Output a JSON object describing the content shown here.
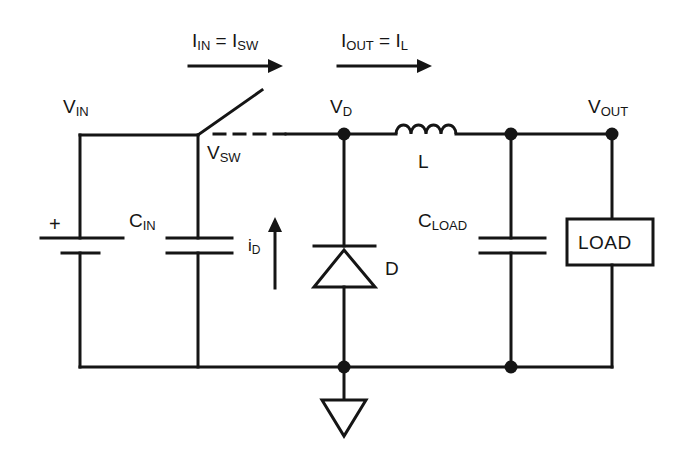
{
  "diagram": {
    "type": "circuit-schematic",
    "stroke_color": "#151515",
    "background_color": "#ffffff",
    "line_width": 3
  },
  "labels": {
    "i_in": {
      "main1": "I",
      "sub1": "IN",
      "eq": " = ",
      "main2": "I",
      "sub2": "SW"
    },
    "i_out": {
      "main1": "I",
      "sub1": "OUT",
      "eq": " = ",
      "main2": "I",
      "sub2": "L"
    },
    "v_in": {
      "main": "V",
      "sub": "IN"
    },
    "v_sw": {
      "main": "V",
      "sub": "SW"
    },
    "v_d": {
      "main": "V",
      "sub": "D"
    },
    "v_out": {
      "main": "V",
      "sub": "OUT"
    },
    "c_in": {
      "main": "C",
      "sub": "IN"
    },
    "c_load": {
      "main": "C",
      "sub": "LOAD"
    },
    "i_d": {
      "main": "i",
      "sub": "D"
    },
    "inductor": {
      "main": "L",
      "sub": ""
    },
    "diode": {
      "main": "D",
      "sub": ""
    },
    "load_box": "LOAD",
    "battery_plus": "+"
  },
  "components": [
    {
      "name": "voltage-source-battery",
      "label": "+",
      "terminal_top": "VIN",
      "terminal_bottom": "GND"
    },
    {
      "name": "input-capacitor",
      "label": "CIN"
    },
    {
      "name": "switch",
      "label": "VSW"
    },
    {
      "name": "diode",
      "label": "D"
    },
    {
      "name": "inductor",
      "label": "L"
    },
    {
      "name": "output-capacitor",
      "label": "CLOAD"
    },
    {
      "name": "load",
      "label": "LOAD"
    },
    {
      "name": "ground",
      "label": "GND"
    }
  ],
  "currents": [
    {
      "name": "input-current",
      "label": "IIN = ISW",
      "direction": "right"
    },
    {
      "name": "output-current",
      "label": "IOUT = IL",
      "direction": "right"
    },
    {
      "name": "diode-current",
      "label": "iD",
      "direction": "up"
    }
  ],
  "nodes": [
    {
      "name": "VIN",
      "x": 80,
      "y": 135
    },
    {
      "name": "VSW",
      "x": 198,
      "y": 135
    },
    {
      "name": "VD",
      "x": 344,
      "y": 134
    },
    {
      "name": "CLOAD-node",
      "x": 511,
      "y": 134
    },
    {
      "name": "VOUT",
      "x": 612,
      "y": 134
    },
    {
      "name": "GND-bus",
      "x": 344,
      "y": 367
    }
  ]
}
